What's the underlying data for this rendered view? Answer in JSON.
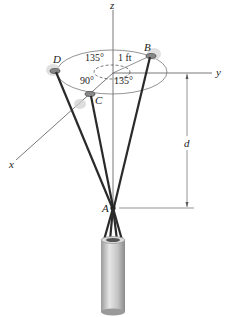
{
  "figure": {
    "axes": {
      "z": "z",
      "y": "y",
      "x": "x"
    },
    "points": {
      "A": "A",
      "B": "B",
      "C": "C",
      "D": "D"
    },
    "angles": {
      "DB": "135°",
      "DC": "90°",
      "CB": "135°"
    },
    "radius_label": "1 ft",
    "dimension_label": "d",
    "colors": {
      "cable": "#2a2a2a",
      "axis": "#555555",
      "cylinder": "#cfcfcf"
    }
  }
}
